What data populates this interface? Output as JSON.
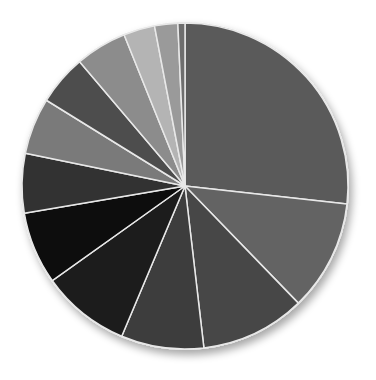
{
  "chart_data": {
    "type": "pie",
    "title": "",
    "legend": "none",
    "start_angle_deg": 0,
    "direction": "clockwise",
    "slices": [
      {
        "label": "Slice 1",
        "value": 26.8,
        "color": "#5a5a5a"
      },
      {
        "label": "Slice 2",
        "value": 11.0,
        "color": "#636363"
      },
      {
        "label": "Slice 3",
        "value": 10.4,
        "color": "#464646"
      },
      {
        "label": "Slice 4",
        "value": 8.2,
        "color": "#3c3c3c"
      },
      {
        "label": "Slice 5",
        "value": 8.8,
        "color": "#1e1e1e"
      },
      {
        "label": "Slice 6",
        "value": 7.2,
        "color": "#080808"
      },
      {
        "label": "Slice 7",
        "value": 5.9,
        "color": "#333333"
      },
      {
        "label": "Slice 8",
        "value": 5.6,
        "color": "#7a7a7a"
      },
      {
        "label": "Slice 9",
        "value": 5.0,
        "color": "#4e4e4e"
      },
      {
        "label": "Slice 10",
        "value": 5.1,
        "color": "#8c8c8c"
      },
      {
        "label": "Slice 11",
        "value": 3.1,
        "color": "#b4b4b4"
      },
      {
        "label": "Slice 12",
        "value": 2.3,
        "color": "#9a9a9a"
      },
      {
        "label": "Slice 13",
        "value": 0.7,
        "color": "#6e6e6e"
      }
    ],
    "values": [
      26.8,
      11.0,
      10.4,
      8.2,
      8.8,
      7.2,
      5.9,
      5.6,
      5.0,
      5.1,
      3.1,
      2.3,
      0.7
    ],
    "categories": [
      "Slice 1",
      "Slice 2",
      "Slice 3",
      "Slice 4",
      "Slice 5",
      "Slice 6",
      "Slice 7",
      "Slice 8",
      "Slice 9",
      "Slice 10",
      "Slice 11",
      "Slice 12",
      "Slice 13"
    ]
  },
  "style": {
    "separator_color": "#e8e8e8",
    "shadow_color": "#c8c8c8"
  }
}
